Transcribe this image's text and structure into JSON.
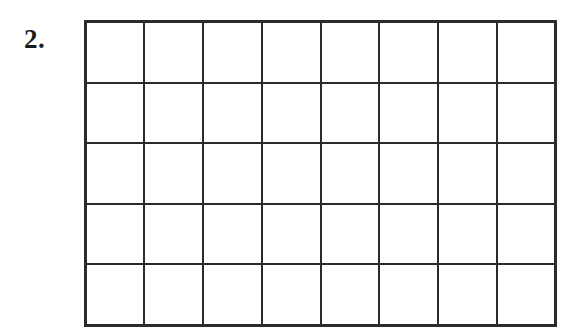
{
  "page": {
    "background_color": "#ffffff",
    "width": 585,
    "height": 334
  },
  "problem": {
    "number_label": "2.",
    "text_color": "#1a1a1a"
  },
  "grid": {
    "columns": 8,
    "rows": 5,
    "line_color": "#2b2b2b",
    "line_width_px": 2,
    "cell_fill": "#ffffff",
    "all_cells_empty": true,
    "cells": [
      [
        "",
        "",
        "",
        "",
        "",
        "",
        "",
        ""
      ],
      [
        "",
        "",
        "",
        "",
        "",
        "",
        "",
        ""
      ],
      [
        "",
        "",
        "",
        "",
        "",
        "",
        "",
        ""
      ],
      [
        "",
        "",
        "",
        "",
        "",
        "",
        "",
        ""
      ],
      [
        "",
        "",
        "",
        "",
        "",
        "",
        "",
        ""
      ]
    ]
  }
}
